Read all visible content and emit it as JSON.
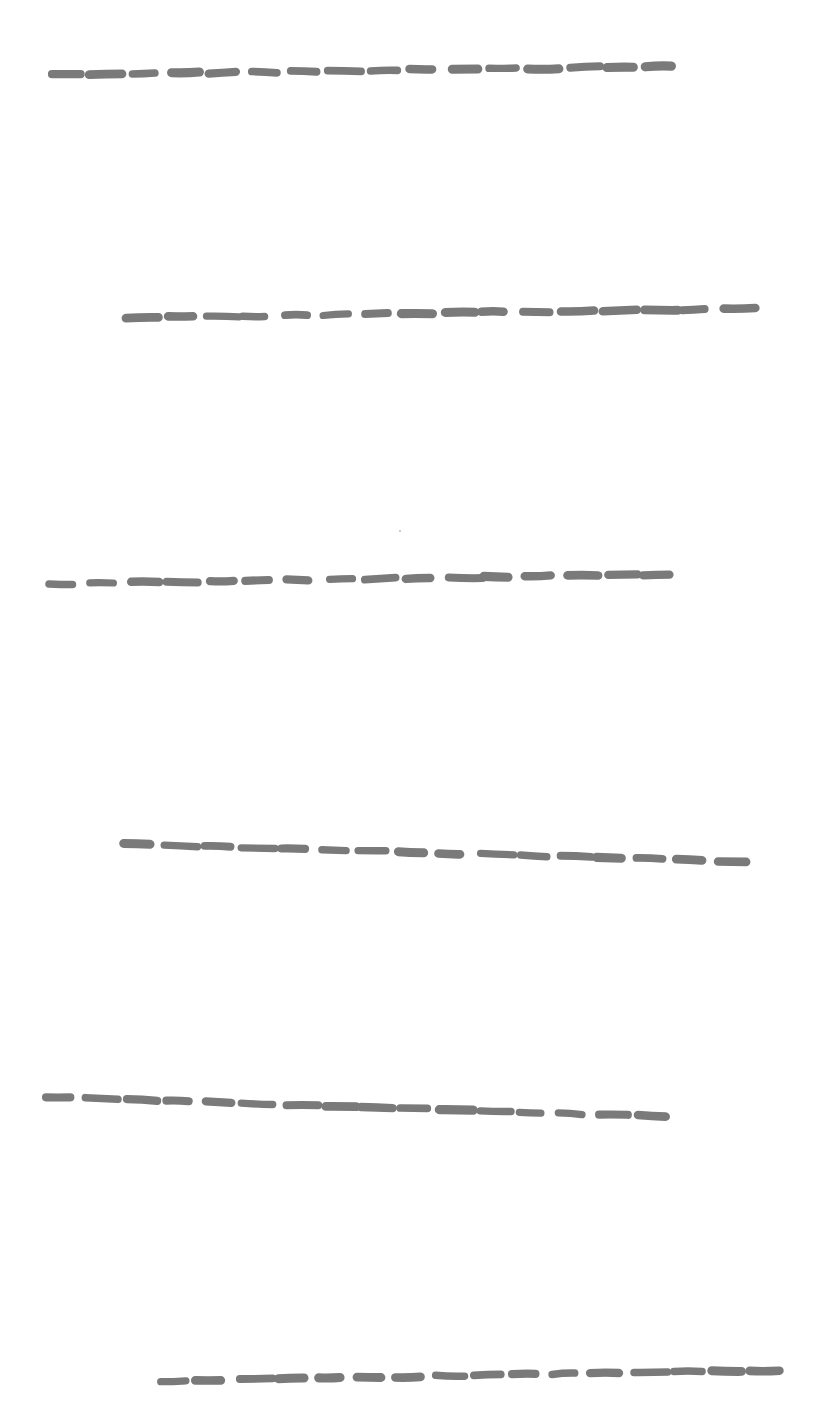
{
  "page": {
    "background": "#ffffff",
    "width": 818,
    "height": 1404
  },
  "style": {
    "stroke_color": "#7a7a7a",
    "stroke_width": 8,
    "dash_count": 16,
    "dash_fill_ratio": 0.72
  },
  "lines": [
    {
      "id": "line-1",
      "x1": 52,
      "y1": 75,
      "x2": 688,
      "y2": 66,
      "wobble": 2.0
    },
    {
      "id": "line-2",
      "x1": 126,
      "y1": 318,
      "x2": 762,
      "y2": 308,
      "wobble": 2.0
    },
    {
      "id": "line-3",
      "x1": 49,
      "y1": 584,
      "x2": 685,
      "y2": 574,
      "wobble": 2.0
    },
    {
      "id": "line-4",
      "x1": 123,
      "y1": 844,
      "x2": 758,
      "y2": 862,
      "wobble": 1.5
    },
    {
      "id": "line-5",
      "x1": 46,
      "y1": 1097,
      "x2": 680,
      "y2": 1117,
      "wobble": 1.5
    },
    {
      "id": "line-6",
      "x1": 158,
      "y1": 1381,
      "x2": 790,
      "y2": 1370,
      "wobble": 2.0
    }
  ],
  "speck": {
    "x": 399,
    "y": 530
  }
}
